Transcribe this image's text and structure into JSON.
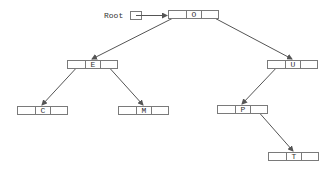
{
  "root_label": "Root",
  "colors": {
    "line": "#555555",
    "box": "#7a7a7a",
    "text": "#333333"
  },
  "nodes": [
    {
      "id": "O",
      "label": "O",
      "x": 168,
      "y": 10
    },
    {
      "id": "E",
      "label": "E",
      "x": 67,
      "y": 60
    },
    {
      "id": "U",
      "label": "U",
      "x": 267,
      "y": 60
    },
    {
      "id": "C",
      "label": "C",
      "x": 17,
      "y": 106
    },
    {
      "id": "M",
      "label": "M",
      "x": 118,
      "y": 106
    },
    {
      "id": "P",
      "label": "P",
      "x": 217,
      "y": 105
    },
    {
      "id": "T",
      "label": "T",
      "x": 268,
      "y": 152
    }
  ],
  "edges": [
    {
      "from": "O",
      "to": "E",
      "side": "left"
    },
    {
      "from": "O",
      "to": "U",
      "side": "right"
    },
    {
      "from": "E",
      "to": "C",
      "side": "left"
    },
    {
      "from": "E",
      "to": "M",
      "side": "right"
    },
    {
      "from": "U",
      "to": "P",
      "side": "left"
    },
    {
      "from": "P",
      "to": "T",
      "side": "right"
    }
  ]
}
